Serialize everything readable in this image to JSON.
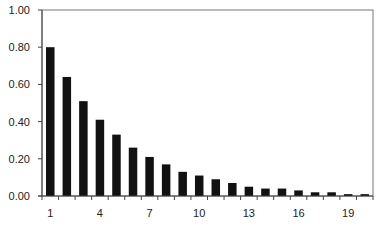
{
  "chart_data": {
    "type": "bar",
    "title": "",
    "xlabel": "",
    "ylabel": "",
    "categories": [
      1,
      2,
      3,
      4,
      5,
      6,
      7,
      8,
      9,
      10,
      11,
      12,
      13,
      14,
      15,
      16,
      17,
      18,
      19,
      20
    ],
    "values": [
      0.8,
      0.64,
      0.51,
      0.41,
      0.33,
      0.26,
      0.21,
      0.17,
      0.13,
      0.11,
      0.09,
      0.07,
      0.05,
      0.04,
      0.04,
      0.03,
      0.02,
      0.02,
      0.01,
      0.01
    ],
    "ylim": [
      0,
      1.0
    ],
    "yticks": [
      "0.00",
      "0.20",
      "0.40",
      "0.60",
      "0.80",
      "1.00"
    ],
    "xtick_labels": [
      "1",
      "4",
      "7",
      "10",
      "13",
      "16",
      "19"
    ],
    "xtick_label_positions": [
      1,
      4,
      7,
      10,
      13,
      16,
      19
    ],
    "grid": false,
    "legend": null,
    "bar_color": "#111111"
  }
}
